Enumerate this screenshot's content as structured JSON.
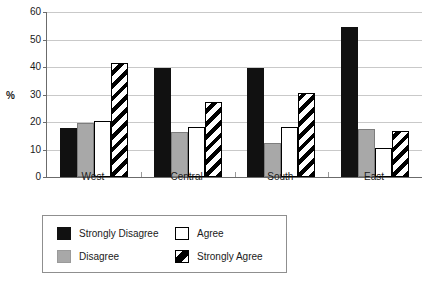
{
  "chart_data": {
    "type": "bar",
    "title": "",
    "subtitle": "",
    "xlabel": "",
    "ylabel": "%",
    "ylim": [
      0,
      60
    ],
    "yticks": [
      0,
      10,
      20,
      30,
      40,
      50,
      60
    ],
    "ytick_labels": [
      "0",
      "10",
      "20",
      "30",
      "40",
      "50",
      "60"
    ],
    "grid": true,
    "grid_axis": "y",
    "legend_position": "bottom-left",
    "categories": [
      "West",
      "Central",
      "South",
      "East"
    ],
    "series": [
      {
        "name": "Strongly Disagree",
        "style": "solid-black",
        "color": "#111111",
        "values": [
          18.0,
          39.5,
          39.8,
          54.6
        ]
      },
      {
        "name": "Disagree",
        "style": "solid-gray",
        "color": "#a8a8a8",
        "values": [
          19.7,
          16.4,
          12.2,
          17.3
        ]
      },
      {
        "name": "Agree",
        "style": "solid-white",
        "color": "#ffffff",
        "values": [
          20.4,
          18.2,
          18.2,
          10.4
        ]
      },
      {
        "name": "Strongly Agree",
        "style": "diagonal-hatch",
        "color": "#ffffff",
        "values": [
          41.5,
          27.3,
          30.4,
          16.6
        ]
      }
    ]
  },
  "legend": {
    "entries": [
      {
        "label": "Strongly Disagree",
        "series_index": 0
      },
      {
        "label": "Agree",
        "series_index": 2
      },
      {
        "label": "Disagree",
        "series_index": 1
      },
      {
        "label": "Strongly Agree",
        "series_index": 3
      }
    ]
  },
  "colors": {
    "axis": "#6b6b6b",
    "gridline": "#c9c9c9",
    "text": "#1a1a1a",
    "legend_border": "#8f8f8f",
    "background": "#ffffff"
  }
}
